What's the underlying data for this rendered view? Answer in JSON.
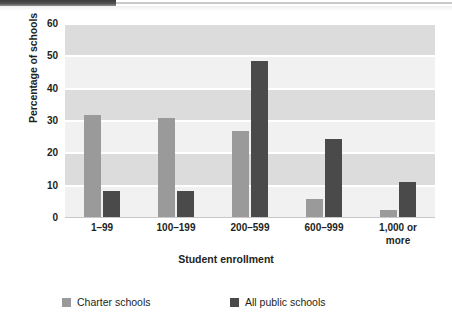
{
  "chart_data": {
    "type": "bar",
    "title": "",
    "xlabel": "Student enrollment",
    "ylabel": "Percentage of schools",
    "categories": [
      "1–99",
      "100–199",
      "200–599",
      "600–999",
      "1,000 or more"
    ],
    "series": [
      {
        "name": "Charter schools",
        "color": "#9a9a9a",
        "values": [
          32,
          31,
          27,
          6,
          2.5
        ]
      },
      {
        "name": "All public schools",
        "color": "#4a4a4a",
        "values": [
          8.5,
          8.5,
          48.5,
          24.5,
          11
        ]
      }
    ],
    "ylim": [
      0,
      60
    ],
    "yticks": [
      0,
      10,
      20,
      30,
      40,
      50,
      60
    ],
    "ytick_labels": [
      "0",
      "10",
      "20",
      "30",
      "40",
      "50",
      "60"
    ],
    "grid": true,
    "grid_orientation": "horizontal",
    "legend_position": "bottom",
    "plot_background": "#f1f1f1",
    "band_color": "#dcdcdc"
  },
  "axes": {
    "y_title": "Percentage of schools",
    "x_title": "Student enrollment",
    "y_ticks": [
      {
        "label": "60",
        "value": 60
      },
      {
        "label": "50",
        "value": 50
      },
      {
        "label": "40",
        "value": 40
      },
      {
        "label": "30",
        "value": 30
      },
      {
        "label": "20",
        "value": 20
      },
      {
        "label": "10",
        "value": 10
      },
      {
        "label": "0",
        "value": 0
      }
    ],
    "x_ticks": [
      {
        "line1": "1–99",
        "line2": ""
      },
      {
        "line1": "100–199",
        "line2": ""
      },
      {
        "line1": "200–599",
        "line2": ""
      },
      {
        "line1": "600–999",
        "line2": ""
      },
      {
        "line1": "1,000 or",
        "line2": "more"
      }
    ]
  },
  "legend": {
    "items": [
      {
        "label": "Charter schools",
        "color": "#9a9a9a"
      },
      {
        "label": "All public schools",
        "color": "#4a4a4a"
      }
    ]
  }
}
